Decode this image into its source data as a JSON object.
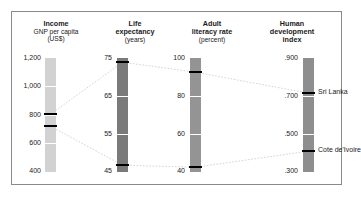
{
  "figure": {
    "frame_color": "#8a8a8a",
    "background": "#ffffff"
  },
  "chart_data": {
    "type": "line",
    "title": "",
    "subtitle": "",
    "legend_position": "inline-right",
    "grid": true,
    "axes": [
      {
        "id": "income",
        "title": "Income",
        "sub1": "GNP per capita",
        "sub2": "(US$)",
        "unit": "US$",
        "ticks": [
          "1,200",
          "1,000",
          "800",
          "600",
          "400"
        ],
        "tick_values": [
          1200,
          1000,
          800,
          600,
          400
        ],
        "range": [
          400,
          1200
        ],
        "bar_color": "#d2d2d2",
        "values": [
          {
            "country": "Sri Lanka",
            "value": 800,
            "display": "800"
          },
          {
            "country": "Cote de'Ivoire",
            "value": 710,
            "display": "710"
          }
        ]
      },
      {
        "id": "life-expectancy",
        "title": "Life",
        "sub1": "expectancy",
        "sub2": "(years)",
        "unit": "years",
        "ticks": [
          "75",
          "65",
          "55",
          "45"
        ],
        "tick_values": [
          75,
          65,
          55,
          45
        ],
        "range": [
          45,
          75
        ],
        "bar_color": "#7a7a7a",
        "values": [
          {
            "country": "Sri Lanka",
            "value": 74,
            "display": "74"
          },
          {
            "country": "Cote de'Ivoire",
            "value": 46,
            "display": "46"
          }
        ]
      },
      {
        "id": "adult-literacy-rate",
        "title": "Adult",
        "sub1": "literacy rate",
        "sub2": "(percent)",
        "unit": "percent",
        "ticks": [
          "100",
          "80",
          "60",
          "40"
        ],
        "tick_values": [
          100,
          80,
          60,
          40
        ],
        "range": [
          40,
          100
        ],
        "bar_color": "#949494",
        "values": [
          {
            "country": "Sri Lanka",
            "value": 90,
            "display": "90"
          },
          {
            "country": "Cote de'Ivoire",
            "value": 42,
            "display": "42"
          }
        ]
      },
      {
        "id": "human-development-index",
        "title": "Human",
        "sub1": "development",
        "sub2": "index",
        "unit": "index",
        "ticks": [
          ".900",
          ".700",
          ".500",
          ".300"
        ],
        "tick_values": [
          0.9,
          0.7,
          0.5,
          0.3
        ],
        "range": [
          0.3,
          0.9
        ],
        "bar_color": "#8e8e8e",
        "values": [
          {
            "country": "Sri Lanka",
            "value": 0.72,
            "display": ".720"
          },
          {
            "country": "Cote de'Ivoire",
            "value": 0.43,
            "display": ".430"
          }
        ]
      }
    ],
    "series": [
      {
        "name": "Sri Lanka",
        "values": [
          800,
          74,
          90,
          0.72
        ]
      },
      {
        "name": "Cote de'Ivoire",
        "values": [
          710,
          46,
          42,
          0.43
        ]
      }
    ],
    "labels": {
      "sri_lanka": "Sri Lanka",
      "cote_divoire": "Cote de'Ivoire"
    },
    "connector_color": "#cfcfcf",
    "marker_color": "#000000"
  }
}
